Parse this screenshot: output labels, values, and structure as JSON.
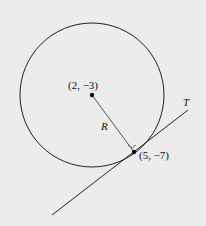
{
  "diagram": {
    "center_label": "(2, −3)",
    "point_label": "(5, −7)",
    "radius_label": "R",
    "tangent_label": "T",
    "colors": {
      "background": "#ececec",
      "stroke": "#222222",
      "radius_line": "#555555"
    }
  }
}
